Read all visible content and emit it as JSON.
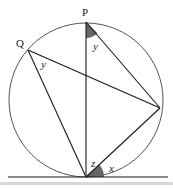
{
  "diagram": {
    "points": {
      "P": {
        "label": "P",
        "x": 86,
        "y": 22
      },
      "Q": {
        "label": "Q",
        "x": 28,
        "y": 50
      },
      "R": {
        "label": "",
        "x": 160,
        "y": 108
      },
      "T": {
        "label": "",
        "x": 86,
        "y": 177
      }
    },
    "circle": {
      "cx": 86,
      "cy": 100,
      "r": 77
    },
    "tangent": {
      "x1": 8,
      "y1": 177,
      "x2": 168,
      "y2": 177
    },
    "angle_labels": {
      "y_at_P": "y",
      "y_at_Q": "y",
      "z_at_T": "z",
      "x_at_T": "x"
    },
    "colors": {
      "line": "#1a1a1a",
      "circle": "#555555",
      "shade": "#666666",
      "footer_bar": "#d9d9d9"
    }
  }
}
